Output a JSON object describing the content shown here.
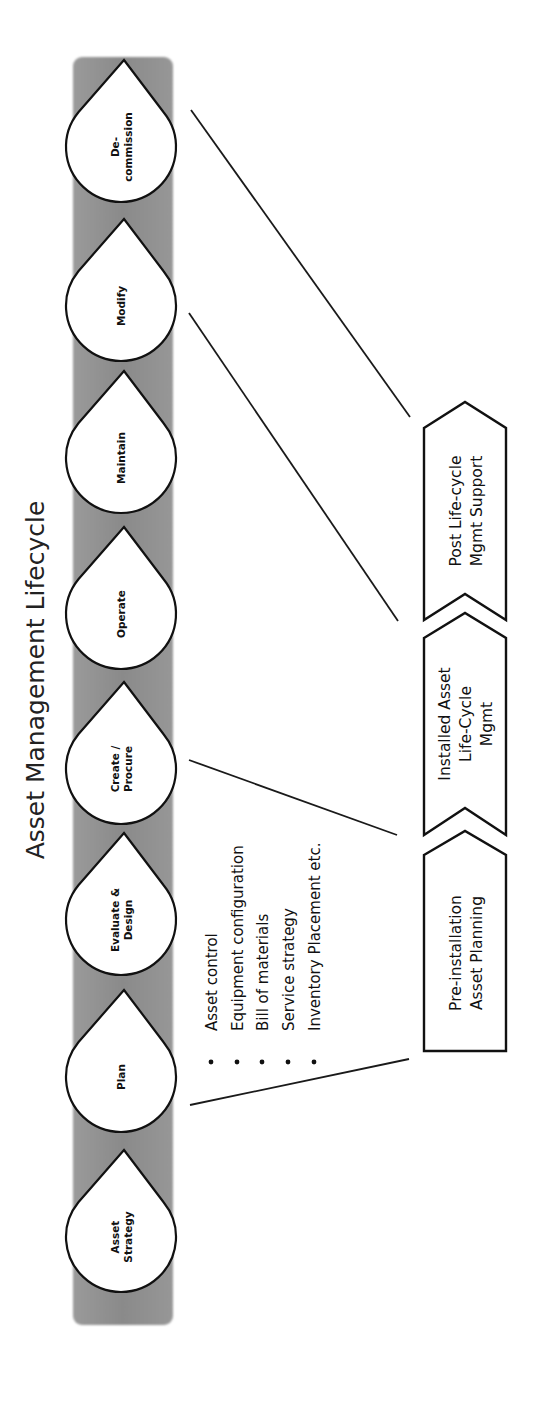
{
  "title": "Asset Management Lifecycle",
  "stages": [
    {
      "lines": [
        "De-",
        "commission"
      ],
      "tip_y": 60
    },
    {
      "lines": [
        "Modify"
      ],
      "tip_y": 219
    },
    {
      "lines": [
        "Maintain"
      ],
      "tip_y": 371
    },
    {
      "lines": [
        "Operate"
      ],
      "tip_y": 527
    },
    {
      "lines": [
        "Create /",
        "Procure"
      ],
      "tip_y": 682
    },
    {
      "lines": [
        "Evaluate &",
        "Design"
      ],
      "tip_y": 833
    },
    {
      "lines": [
        "Plan"
      ],
      "tip_y": 990
    },
    {
      "lines": [
        "Asset",
        "Strategy"
      ],
      "tip_y": 1150
    }
  ],
  "bullets": [
    "Asset control",
    "Equipment configuration",
    "Bill of materials",
    "Service strategy",
    "Inventory Placement etc."
  ],
  "phases": [
    {
      "lines": [
        "Post Life-cycle",
        "Mgmt Support"
      ]
    },
    {
      "lines": [
        "Installed Asset",
        "Life-Cycle",
        "Mgmt"
      ]
    },
    {
      "lines": [
        "Pre-installation",
        "Asset Planning"
      ]
    }
  ],
  "colors": {
    "band": "#8e8e8e",
    "outline": "#111111",
    "fill": "#ffffff"
  }
}
